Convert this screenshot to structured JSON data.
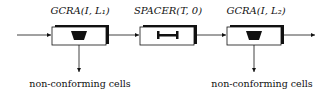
{
  "diagram": {
    "blocks": [
      {
        "label": "GCRA(I, L₁)",
        "icon": "leaky-bucket-icon",
        "output_caption": "non-conforming cells"
      },
      {
        "label": "SPACER(T, 0)",
        "icon": "spacer-icon",
        "output_caption": ""
      },
      {
        "label": "GCRA(I, L₂)",
        "icon": "leaky-bucket-icon",
        "output_caption": "non-conforming cells"
      }
    ],
    "captions": {
      "left": "non-conforming cells",
      "right": "non-conforming cells"
    },
    "colors": {
      "stroke": "#111111",
      "background": "#ffffff"
    }
  }
}
